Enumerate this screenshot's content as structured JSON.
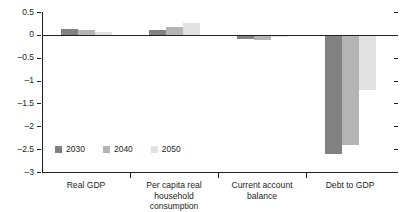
{
  "chart_data": {
    "type": "bar",
    "title": "",
    "xlabel": "",
    "ylabel": "",
    "ylim": [
      -3,
      0.5
    ],
    "yticks": [
      "0.5",
      "0",
      "-0.5",
      "-1",
      "-1.5",
      "-2",
      "-2.5",
      "-3"
    ],
    "ytick_values": [
      0.5,
      0,
      -0.5,
      -1,
      -1.5,
      -2,
      -2.5,
      -3
    ],
    "grid": false,
    "legend_position": "bottom-left",
    "categories": [
      "Real GDP",
      "Per capita real household consumption",
      "Current account balance",
      "Debt to GDP"
    ],
    "category_lines": [
      [
        "Real GDP"
      ],
      [
        "Per capita real",
        "household consumption"
      ],
      [
        "Current account",
        "balance"
      ],
      [
        "Debt to GDP"
      ]
    ],
    "series": [
      {
        "name": "2030",
        "color": "#818181",
        "values": [
          0.12,
          0.1,
          -0.08,
          -2.6
        ]
      },
      {
        "name": "2040",
        "color": "#b4b4b4",
        "values": [
          0.1,
          0.18,
          -0.12,
          -2.42
        ]
      },
      {
        "name": "2050",
        "color": "#e2e2e2",
        "values": [
          0.06,
          0.25,
          -0.05,
          -1.2
        ]
      }
    ]
  },
  "legend": {
    "items": [
      {
        "label": "2030",
        "color": "#818181"
      },
      {
        "label": "2040",
        "color": "#b4b4b4"
      },
      {
        "label": "2050",
        "color": "#e2e2e2"
      }
    ]
  }
}
